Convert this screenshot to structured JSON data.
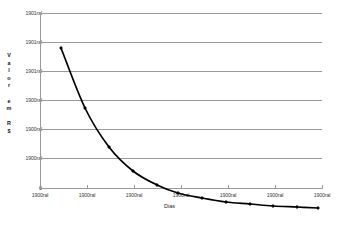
{
  "chart_data": {
    "type": "line",
    "title": "",
    "subtitle": "",
    "xlabel": "Dias",
    "ylabel": "Valor em R$",
    "ylabel_letters": [
      "V",
      "a",
      "l",
      "o",
      "r",
      "",
      "e",
      "m",
      "",
      "R",
      "$"
    ],
    "grid": true,
    "legend": false,
    "legend_position": "none",
    "marker": "diamond",
    "line_color": "#000000",
    "marker_color": "#000000",
    "grid_color": "#9a9a9a",
    "axis_color": "#9a9a9a",
    "background": "#ffffff",
    "x_tick_labels": [
      "1900ral",
      "1900ral",
      "1900ral",
      "1900ral",
      "1900ral",
      "1900ral",
      "1900ral"
    ],
    "y_tick_labels": [
      "1901ral",
      "1901ral",
      "1901ral",
      "1900ral",
      "1900ral",
      "1900ral",
      "0"
    ],
    "ylim": [
      0,
      6
    ],
    "xlim": [
      0,
      6
    ],
    "x": [
      0.6,
      1.0,
      1.4,
      1.8,
      2.2,
      2.6,
      3.0,
      3.4,
      3.9,
      4.4,
      4.9,
      5.4
    ],
    "values": [
      5.55,
      3.5,
      2.18,
      1.35,
      0.85,
      0.52,
      0.33,
      0.2,
      0.13,
      0.08,
      0.05,
      0.03
    ],
    "series": [
      {
        "name": "Valor",
        "values": [
          5.55,
          3.5,
          2.18,
          1.35,
          0.85,
          0.52,
          0.33,
          0.2,
          0.13,
          0.08,
          0.05,
          0.03
        ]
      }
    ],
    "points_px": [
      {
        "x": 61,
        "y": 48
      },
      {
        "x": 85,
        "y": 108
      },
      {
        "x": 109,
        "y": 147
      },
      {
        "x": 133,
        "y": 171
      },
      {
        "x": 157,
        "y": 185
      },
      {
        "x": 178,
        "y": 193
      },
      {
        "x": 202,
        "y": 198
      },
      {
        "x": 226,
        "y": 202
      },
      {
        "x": 250,
        "y": 204
      },
      {
        "x": 273,
        "y": 206
      },
      {
        "x": 297,
        "y": 207
      },
      {
        "x": 318,
        "y": 208
      }
    ]
  }
}
